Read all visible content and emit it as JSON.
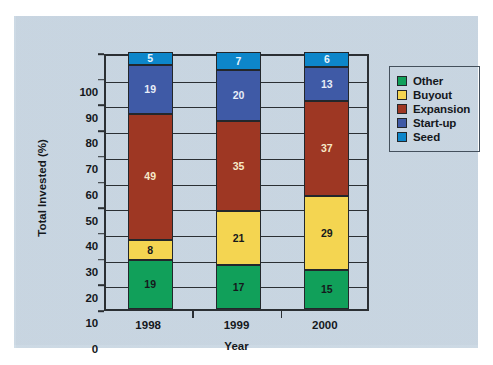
{
  "chart_data": {
    "type": "bar",
    "subtype": "stacked-bar-100",
    "title": "",
    "xlabel": "Year",
    "ylabel": "Total Invested (%)",
    "categories": [
      "1998",
      "1999",
      "2000"
    ],
    "ylim": [
      0,
      100
    ],
    "yticks": [
      0,
      10,
      20,
      30,
      40,
      50,
      60,
      70,
      80,
      90,
      100
    ],
    "ytick_labels": [
      "0",
      "10",
      "20",
      "30",
      "40",
      "50",
      "60",
      "70",
      "80",
      "90",
      "100"
    ],
    "grid": true,
    "grid_axis": "y",
    "legend_position": "right",
    "stack_order_bottom_to_top": [
      "Other",
      "Buyout",
      "Expansion",
      "Start-up",
      "Seed"
    ],
    "series": [
      {
        "name": "Other",
        "color": "#11a05a",
        "label_color": "#15181c",
        "values": [
          19,
          17,
          15
        ]
      },
      {
        "name": "Buyout",
        "color": "#f4d551",
        "label_color": "#15181c",
        "values": [
          8,
          21,
          29
        ]
      },
      {
        "name": "Expansion",
        "color": "#9e3723",
        "label_color": "#f7e9c8",
        "values": [
          49,
          35,
          37
        ]
      },
      {
        "name": "Start-up",
        "color": "#3f5aa6",
        "label_color": "#e8eef8",
        "values": [
          19,
          20,
          13
        ]
      },
      {
        "name": "Seed",
        "color": "#0d86ca",
        "label_color": "#eaf4fb",
        "values": [
          5,
          7,
          6
        ]
      }
    ]
  },
  "legend": {
    "items": [
      {
        "label": "Other",
        "color": "#11a05a"
      },
      {
        "label": "Buyout",
        "color": "#f4d551"
      },
      {
        "label": "Expansion",
        "color": "#9e3723"
      },
      {
        "label": "Start-up",
        "color": "#3f5aa6"
      },
      {
        "label": "Seed",
        "color": "#0d86ca"
      }
    ]
  },
  "colors": {
    "panel_background": "#ccdae6",
    "figure_background": "#ffffff",
    "axis": "#2b2f33",
    "text": "#15181c"
  }
}
